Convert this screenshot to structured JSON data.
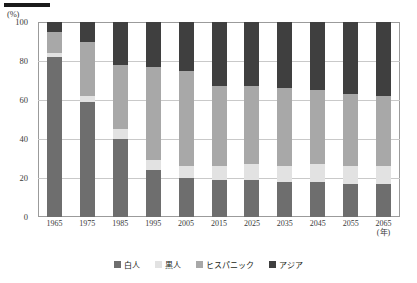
{
  "axis": {
    "unit_label": "(%)",
    "x_unit_label": "(年)",
    "y_ticks": [
      "100",
      "80",
      "60",
      "40",
      "20",
      "0"
    ]
  },
  "legend": {
    "items": [
      {
        "label": "白人",
        "color": "#6e6e6e"
      },
      {
        "label": "黒人",
        "color": "#e2e2e2"
      },
      {
        "label": "ヒスパニック",
        "color": "#a8a8a8"
      },
      {
        "label": "アジア",
        "color": "#3f3f3f"
      }
    ]
  },
  "chart_data": {
    "type": "bar",
    "stacked": true,
    "title": "",
    "xlabel": "(年)",
    "ylabel": "(%)",
    "ylim": [
      0,
      100
    ],
    "grid": true,
    "legend_position": "bottom",
    "categories": [
      "1965",
      "1975",
      "1985",
      "1995",
      "2005",
      "2015",
      "2025",
      "2035",
      "2045",
      "2055",
      "2065"
    ],
    "series": [
      {
        "name": "白人",
        "color": "#6e6e6e",
        "values": [
          82,
          59,
          40,
          24,
          20,
          19,
          19,
          18,
          18,
          17,
          17
        ]
      },
      {
        "name": "黒人",
        "color": "#e2e2e2",
        "values": [
          2,
          3,
          5,
          5,
          6,
          7,
          8,
          8,
          9,
          9,
          9
        ]
      },
      {
        "name": "ヒスパニック",
        "color": "#a8a8a8",
        "values": [
          11,
          28,
          33,
          48,
          49,
          41,
          40,
          40,
          38,
          37,
          36
        ]
      },
      {
        "name": "アジア",
        "color": "#3f3f3f",
        "values": [
          5,
          10,
          22,
          23,
          25,
          33,
          33,
          34,
          35,
          37,
          38
        ]
      }
    ]
  }
}
